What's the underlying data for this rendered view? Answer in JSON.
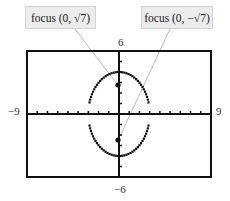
{
  "chart_data": {
    "type": "scatter",
    "title": "",
    "xlabel": "",
    "ylabel": "",
    "xlim": [
      -9,
      9
    ],
    "ylim": [
      -6,
      6
    ],
    "grid": false,
    "axis_tick_labels": {
      "x_min": "−9",
      "x_max": "9",
      "y_max": "6",
      "y_min": "−6"
    },
    "curve": {
      "name": "ellipse",
      "center": [
        0,
        0
      ],
      "semi_major_y": 4,
      "semi_minor_x": 3,
      "style": "dotted"
    },
    "points": [
      {
        "name": "focus-top",
        "x": 0,
        "y": 2.6458
      },
      {
        "name": "focus-bottom",
        "x": 0,
        "y": -2.6458
      }
    ],
    "annotations": [
      {
        "text": "focus (0, √7)",
        "points_to": "focus-top"
      },
      {
        "text": "focus (0, −√7)",
        "points_to": "focus-bottom"
      }
    ]
  },
  "labels": {
    "focus_top": "focus (0, √7)",
    "focus_bottom": "focus (0, −√7)",
    "x_min": "−9",
    "x_max": "9",
    "y_max": "6",
    "y_min": "−6"
  }
}
